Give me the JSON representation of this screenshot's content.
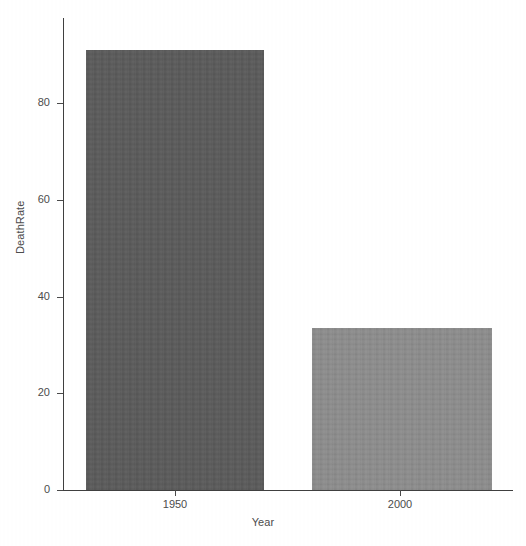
{
  "chart_data": {
    "type": "bar",
    "title": "",
    "subtitle": "",
    "xlabel": "Year",
    "ylabel": "DeathRate",
    "categories": [
      "1950",
      "2000"
    ],
    "values": [
      91,
      33.5
    ],
    "series": [
      {
        "name": "DeathRate",
        "values": [
          91,
          33.5
        ]
      }
    ],
    "ylim": [
      0,
      98
    ],
    "yticks": [
      0,
      20,
      40,
      60,
      80
    ],
    "ytick_labels": [
      "0",
      "20",
      "40",
      "60",
      "80"
    ],
    "xticks": [
      "1950",
      "2000"
    ],
    "xtick_labels": [
      "1950",
      "2000"
    ],
    "grid": false,
    "legend": false,
    "legend_position": "none",
    "bar_colors": [
      "#5a5a5a",
      "#8c8c8c"
    ],
    "background_color": "#ffffff",
    "axis_color": "#3f3f3f",
    "text_color": "#4c4c4c",
    "annotations": []
  },
  "axes": {
    "y_title": "DeathRate",
    "x_title": "Year",
    "y_ticks": [
      {
        "label": "80",
        "value": 80
      },
      {
        "label": "60",
        "value": 60
      },
      {
        "label": "40",
        "value": 40
      },
      {
        "label": "20",
        "value": 20
      },
      {
        "label": "0",
        "value": 0
      }
    ],
    "x_ticks": [
      {
        "label": "1950"
      },
      {
        "label": "2000"
      }
    ]
  },
  "bars": [
    {
      "category": "1950",
      "value": 91,
      "color": "#5a5a5a"
    },
    {
      "category": "2000",
      "value": 33.5,
      "color": "#8c8c8c"
    }
  ]
}
